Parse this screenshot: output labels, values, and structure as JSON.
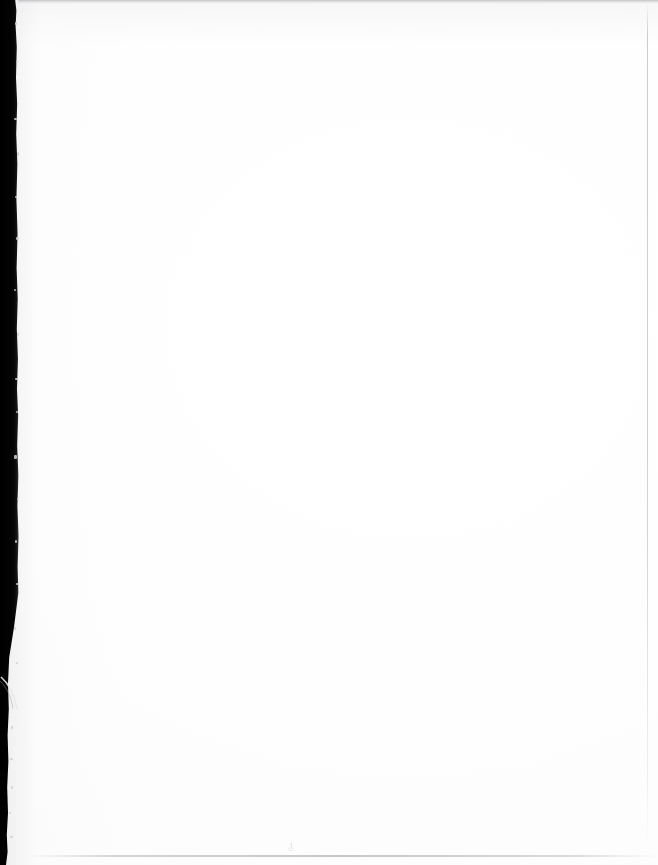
{
  "document": {
    "kind": "scanned-page",
    "page_label": "",
    "body_text": "",
    "is_blank": "true"
  },
  "canvas": {
    "width": "658",
    "height": "865",
    "paper_color": "#ffffff",
    "paper_tint": "#fcfcfc"
  },
  "artifacts": {
    "gutter": {
      "name": "scanner-gutter-shadow",
      "edge": "left",
      "color_core": "#000000",
      "color_falloff": "#3a3a3a",
      "width_px": "20",
      "note": ""
    },
    "top_rule": {
      "name": "top-edge-shadow-line",
      "color": "#96969a",
      "note": ""
    },
    "bottom_rule": {
      "name": "bottom-edge-gray-line",
      "color": "#c4c4c8",
      "note": ""
    },
    "right_rule": {
      "name": "right-edge-gray-line",
      "color": "#c6c6ca",
      "note": ""
    },
    "speck": {
      "name": "dust-speck",
      "color": "#b9b9bd",
      "note": ""
    }
  }
}
